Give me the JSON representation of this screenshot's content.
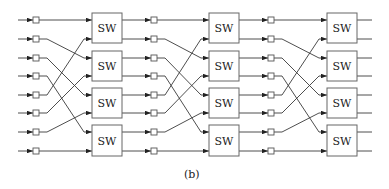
{
  "figure": {
    "caption": "(b)",
    "switch_label": "SW",
    "stages": 3,
    "switches_per_stage": 4,
    "lines": 8,
    "interconnect": "perfect-shuffle",
    "shuffle_map": [
      0,
      2,
      4,
      6,
      1,
      3,
      5,
      7
    ],
    "row_y": [
      20,
      39,
      58,
      76,
      95,
      113,
      132,
      151
    ],
    "switch_y": [
      [
        13,
        43
      ],
      [
        51,
        81
      ],
      [
        88,
        118
      ],
      [
        125,
        156
      ]
    ],
    "stage_geometry": [
      {
        "input_start_x": 18,
        "buffer_x": 33,
        "switch_x": 92
      },
      {
        "input_start_x": 122,
        "buffer_x": 151,
        "switch_x": 209
      },
      {
        "input_start_x": 239,
        "buffer_x": 268,
        "switch_x": 327
      }
    ],
    "switch_width": 30,
    "buffer_size": 6,
    "output_end_x": 372
  }
}
